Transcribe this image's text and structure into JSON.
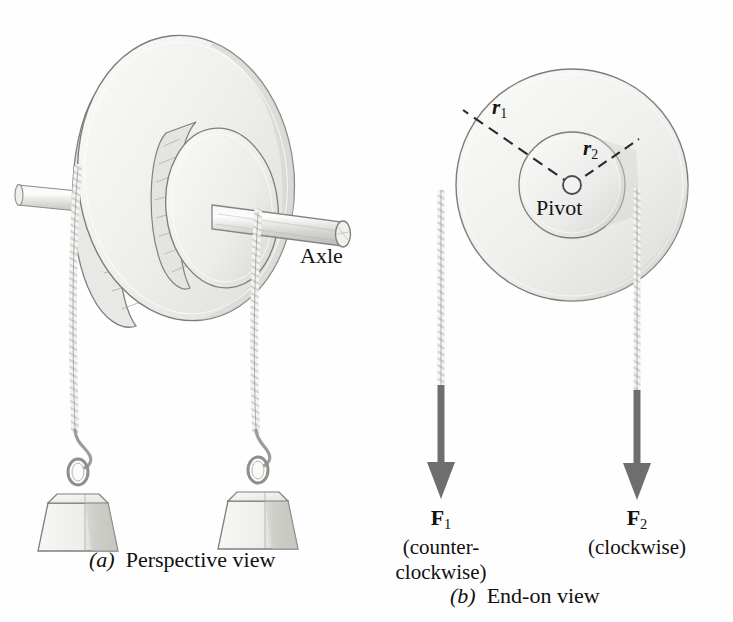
{
  "figure": {
    "kind": "physics-torque-pulley-figure",
    "panels": [
      {
        "id": "a",
        "caption_marker": "(a)",
        "caption_text": "Perspective view",
        "labels": {
          "axle": "Axle"
        }
      },
      {
        "id": "b",
        "caption_marker": "(b)",
        "caption_text": "End-on view",
        "labels": {
          "pivot": "Pivot",
          "r1": "r",
          "r1_sub": "1",
          "r2": "r",
          "r2_sub": "2"
        },
        "forces": [
          {
            "symbol": "F",
            "subscript": "1",
            "sense": "(counter-\nclockwise)"
          },
          {
            "symbol": "F",
            "subscript": "2",
            "sense": "(clockwise)"
          }
        ]
      }
    ],
    "colors": {
      "ink": "#151515",
      "line": "#5a5a5a",
      "arrow": "#6e6e6e",
      "disk_fill": "#f2f2f0",
      "hub_fill": "#ededeb",
      "shade": "#d9d9d6",
      "rope": "#cfcfcc",
      "background": "#fefefe"
    }
  }
}
